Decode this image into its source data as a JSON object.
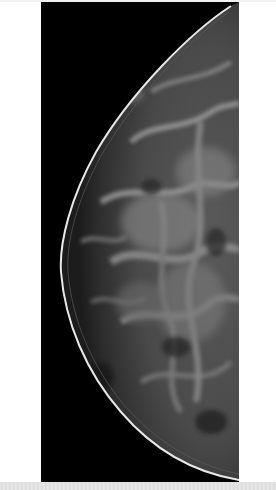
{
  "image": {
    "subject": "mammogram",
    "view": "breast-tissue-xray",
    "colors": {
      "background": "#000000",
      "page": "#ffffff",
      "skin_line": "#e8e8e8",
      "tissue_mid": "#6a6a6a",
      "tissue_dark": "#2a2a2a",
      "bottom_strip": "#e2e2e2"
    }
  }
}
